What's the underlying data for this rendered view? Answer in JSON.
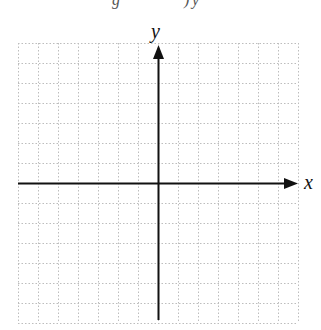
{
  "diagram": {
    "type": "coordinate-grid",
    "x_axis_label": "x",
    "y_axis_label": "y",
    "grid": {
      "columns": 14,
      "rows": 14,
      "cell_px": 20,
      "line_style": "dotted",
      "line_color": "#bdbdbd"
    },
    "axis_color": "#111111",
    "clipped_header_fragments": [
      "g",
      ")",
      "y"
    ]
  }
}
